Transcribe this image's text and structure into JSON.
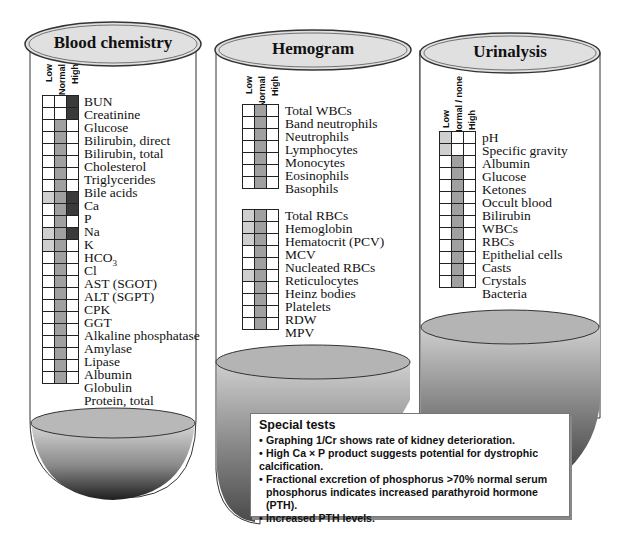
{
  "tubes": [
    {
      "title": "Blood chemistry",
      "columns": [
        "Low",
        "Normal",
        "High"
      ],
      "rows": [
        {
          "label": "BUN",
          "cells": [
            0,
            0,
            3
          ]
        },
        {
          "label": "Creatinine",
          "cells": [
            0,
            0,
            3
          ]
        },
        {
          "label": "Glucose",
          "cells": [
            0,
            2,
            0
          ]
        },
        {
          "label": "Bilirubin, direct",
          "cells": [
            0,
            2,
            0
          ]
        },
        {
          "label": "Bilirubin, total",
          "cells": [
            0,
            2,
            0
          ]
        },
        {
          "label": "Cholesterol",
          "cells": [
            0,
            2,
            0
          ]
        },
        {
          "label": "Triglycerides",
          "cells": [
            0,
            2,
            0
          ]
        },
        {
          "label": "Bile acids",
          "cells": [
            0,
            2,
            0
          ]
        },
        {
          "label": "Ca",
          "cells": [
            1,
            2,
            3
          ]
        },
        {
          "label": "P",
          "cells": [
            0,
            2,
            3
          ]
        },
        {
          "label": "Na",
          "cells": [
            0,
            2,
            0
          ]
        },
        {
          "label": "K",
          "cells": [
            1,
            2,
            3
          ]
        },
        {
          "label": "HCO3",
          "cells": [
            1,
            2,
            0
          ]
        },
        {
          "label": "Cl",
          "cells": [
            0,
            2,
            0
          ]
        },
        {
          "label": "AST (SGOT)",
          "cells": [
            0,
            2,
            0
          ]
        },
        {
          "label": "ALT (SGPT)",
          "cells": [
            0,
            2,
            0
          ]
        },
        {
          "label": "CPK",
          "cells": [
            0,
            2,
            0
          ]
        },
        {
          "label": "GGT",
          "cells": [
            0,
            2,
            0
          ]
        },
        {
          "label": "Alkaline phosphatase",
          "cells": [
            0,
            2,
            0
          ]
        },
        {
          "label": "Amylase",
          "cells": [
            0,
            2,
            0
          ]
        },
        {
          "label": "Lipase",
          "cells": [
            0,
            2,
            0
          ]
        },
        {
          "label": "Albumin",
          "cells": [
            0,
            2,
            0
          ]
        },
        {
          "label": "Globulin",
          "cells": [
            0,
            2,
            0
          ]
        },
        {
          "label": "Protein, total",
          "cells": [
            0,
            2,
            0
          ]
        }
      ]
    },
    {
      "title": "Hemogram",
      "columns": [
        "Low",
        "Normal",
        "High"
      ],
      "groups": [
        {
          "rows": [
            {
              "label": "Total WBCs",
              "cells": [
                0,
                2,
                0
              ]
            },
            {
              "label": "Band neutrophils",
              "cells": [
                0,
                2,
                0
              ]
            },
            {
              "label": "Neutrophils",
              "cells": [
                0,
                2,
                0
              ]
            },
            {
              "label": "Lymphocytes",
              "cells": [
                0,
                2,
                0
              ]
            },
            {
              "label": "Monocytes",
              "cells": [
                0,
                2,
                0
              ]
            },
            {
              "label": "Eosinophils",
              "cells": [
                0,
                2,
                0
              ]
            },
            {
              "label": "Basophils",
              "cells": [
                0,
                2,
                0
              ]
            }
          ]
        },
        {
          "rows": [
            {
              "label": "Total RBCs",
              "cells": [
                1,
                2,
                0
              ]
            },
            {
              "label": "Hemoglobin",
              "cells": [
                1,
                2,
                0
              ]
            },
            {
              "label": "Hematocrit (PCV)",
              "cells": [
                1,
                2,
                0
              ]
            },
            {
              "label": "MCV",
              "cells": [
                0,
                2,
                0
              ]
            },
            {
              "label": "Nucleated RBCs",
              "cells": [
                0,
                2,
                0
              ]
            },
            {
              "label": "Reticulocytes",
              "cells": [
                1,
                2,
                0
              ]
            },
            {
              "label": "Heinz bodies",
              "cells": [
                0,
                2,
                0
              ]
            },
            {
              "label": "Platelets",
              "cells": [
                0,
                2,
                0
              ]
            },
            {
              "label": "RDW",
              "cells": [
                0,
                2,
                0
              ]
            },
            {
              "label": "MPV",
              "cells": [
                0,
                2,
                0
              ]
            }
          ]
        }
      ]
    },
    {
      "title": "Urinalysis",
      "columns": [
        "Low",
        "Normal / none",
        "High"
      ],
      "rows": [
        {
          "label": "pH",
          "cells": [
            1,
            0,
            0
          ]
        },
        {
          "label": "Specific gravity",
          "cells": [
            1,
            0,
            0
          ]
        },
        {
          "label": "Albumin",
          "cells": [
            0,
            2,
            0
          ]
        },
        {
          "label": "Glucose",
          "cells": [
            0,
            2,
            0
          ]
        },
        {
          "label": "Ketones",
          "cells": [
            0,
            2,
            0
          ]
        },
        {
          "label": "Occult blood",
          "cells": [
            0,
            2,
            0
          ]
        },
        {
          "label": "Bilirubin",
          "cells": [
            0,
            2,
            0
          ]
        },
        {
          "label": "WBCs",
          "cells": [
            0,
            2,
            0
          ]
        },
        {
          "label": "RBCs",
          "cells": [
            0,
            2,
            0
          ]
        },
        {
          "label": "Epithelial cells",
          "cells": [
            0,
            2,
            0
          ]
        },
        {
          "label": "Casts",
          "cells": [
            0,
            2,
            0
          ]
        },
        {
          "label": "Crystals",
          "cells": [
            0,
            2,
            0
          ]
        },
        {
          "label": "Bacteria",
          "cells": [
            0,
            2,
            0
          ]
        }
      ]
    }
  ],
  "legend": {
    "cell_levels": {
      "0": "empty",
      "1": "light shading",
      "2": "medium shading",
      "3": "dark shading"
    },
    "colors": {
      "empty": "#ffffff",
      "light": "#cfcfcf",
      "medium": "#a0a0a0",
      "dark": "#3a3a3a"
    }
  },
  "special_tests": {
    "title": "Special tests",
    "items": [
      "Graphing 1/Cr shows rate of kidney deterioration.",
      "High Ca × P product suggests potential for dystrophic calcification.",
      "Fractional excretion of phosphorus >70% normal serum",
      "phosphorus indicates increased parathyroid hormone (PTH).",
      "Increased PTH levels."
    ]
  }
}
